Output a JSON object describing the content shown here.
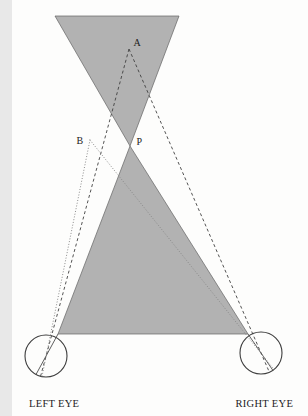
{
  "diagram": {
    "colors": {
      "background": "#fdfdfc",
      "shade": "#b2b2b2",
      "shade_edge": "#636363",
      "solid_line": "#4d4d4d",
      "dashed_line": "#3f3f3f",
      "dotted_line": "#8a8a8a",
      "eye_outline": "#3d3d3d",
      "label": "#1c1c1c"
    },
    "points": {
      "A": {
        "x": 117,
        "y": 49
      },
      "B": {
        "x": 78,
        "y": 140
      },
      "P": {
        "x": 118,
        "y": 146
      }
    },
    "shaded_regions": [
      {
        "name": "upper-shaded-region",
        "points": "43,16 167,16 118,146"
      },
      {
        "name": "lower-shaded-region",
        "points": "118,146 236,334 46,334"
      }
    ],
    "eyes": [
      {
        "name": "left-eye-circle",
        "cx": 34,
        "cy": 356,
        "r": 21
      },
      {
        "name": "right-eye-circle",
        "cx": 249,
        "cy": 353,
        "r": 21
      }
    ],
    "sight_lines": [
      {
        "name": "solid-axis-left-eye",
        "style": "solid",
        "x1": 46,
        "y1": 334,
        "x2": 24,
        "y2": 374.5
      },
      {
        "name": "solid-axis-right-eye",
        "style": "solid",
        "x1": 236,
        "y1": 334,
        "x2": 261,
        "y2": 370.5
      },
      {
        "name": "dashed-line-a-to-left-eye",
        "style": "dashed",
        "x1": 117,
        "y1": 49,
        "x2": 28.5,
        "y2": 376.5
      },
      {
        "name": "dashed-line-a-to-right-eye",
        "style": "dashed",
        "x1": 117,
        "y1": 49,
        "x2": 257.5,
        "y2": 372.5
      },
      {
        "name": "dotted-line-b-to-left-eye",
        "style": "dotted",
        "x1": 78,
        "y1": 140,
        "x2": 30,
        "y2": 376.5
      },
      {
        "name": "dotted-line-b-to-right-eye",
        "style": "dotted",
        "x1": 78,
        "y1": 140,
        "x2": 262,
        "y2": 369.5
      }
    ],
    "labels": {
      "point_a": {
        "text": "A",
        "x": 121.5,
        "y": 46,
        "class": "pt-label"
      },
      "point_b": {
        "text": "B",
        "x": 64.5,
        "y": 144,
        "class": "pt-label"
      },
      "point_p": {
        "text": "P",
        "x": 124.5,
        "y": 145,
        "class": "pt-label"
      },
      "left_eye": {
        "text": "LEFT EYE",
        "x": 17,
        "y": 407,
        "class": "eye-label"
      },
      "right_eye": {
        "text": "RIGHT EYE",
        "x": 223.5,
        "y": 407,
        "class": "eye-label"
      }
    }
  }
}
